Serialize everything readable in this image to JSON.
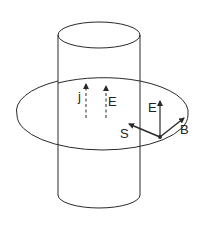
{
  "diagram": {
    "type": "physics-illustration",
    "colors": {
      "stroke": "#2a2a2a",
      "background": "#ffffff"
    },
    "labels": {
      "current_density": "j",
      "field_inside": "E",
      "field_surface": "E",
      "poynting": "S",
      "magnetic": "B"
    }
  }
}
